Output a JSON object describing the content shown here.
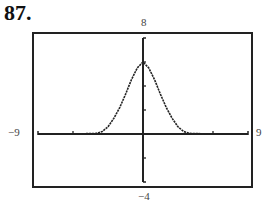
{
  "problem": {
    "number": "87."
  },
  "window": {
    "xmin_label": "−9",
    "xmax_label": "9",
    "ymin_label": "−4",
    "ymax_label": "8"
  },
  "chart_data": {
    "type": "line",
    "title": "87.",
    "xlabel": "",
    "ylabel": "",
    "xlim": [
      -9,
      9
    ],
    "ylim": [
      -4,
      8
    ],
    "grid": false,
    "legend": null,
    "frame": "graphing-calculator window",
    "window_labels": {
      "xmin": "-9",
      "xmax": "9",
      "ymin": "-4",
      "ymax": "8"
    },
    "x_ticks_visible": [
      -6,
      6
    ],
    "y_ticks_visible": [
      -2,
      2,
      4,
      6
    ],
    "series": [
      {
        "name": "f(x)",
        "x": [
          -9,
          -6,
          -4,
          -3.5,
          -3,
          -2.5,
          -2,
          -1.5,
          -1,
          -0.5,
          0,
          0.5,
          1,
          1.5,
          2,
          2.5,
          3,
          3.5,
          4,
          6,
          9
        ],
        "y": [
          0,
          0,
          0.05,
          0.2,
          0.6,
          1.3,
          2.2,
          3.3,
          4.5,
          5.5,
          6,
          5.5,
          4.5,
          3.3,
          2.2,
          1.3,
          0.6,
          0.2,
          0.05,
          0,
          0
        ]
      }
    ]
  }
}
